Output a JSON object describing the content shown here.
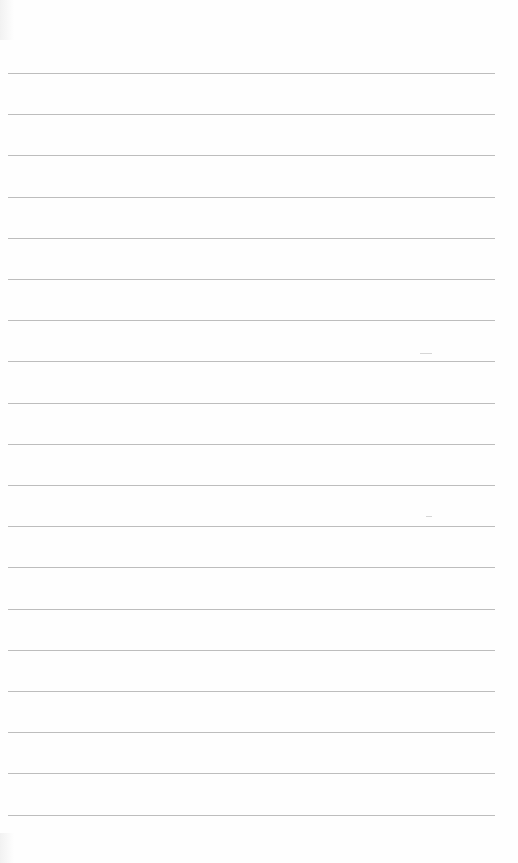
{
  "document": {
    "type": "blank lined paper",
    "rule_color": "#bdbdbd",
    "background": "#fefefe",
    "line_count": 19,
    "first_line_y": 73,
    "line_spacing": 41.2,
    "text": ""
  }
}
